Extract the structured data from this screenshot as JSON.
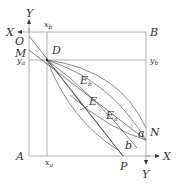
{
  "diagram": {
    "type": "geometric construction",
    "points": {
      "O": "O",
      "M": "M",
      "D": "D",
      "B": "B",
      "A": "A",
      "N": "N",
      "P": "P",
      "E": "E",
      "Eb_main": "E",
      "Eb_sub": "b",
      "Ea_main": "E",
      "Ea_sub": "a",
      "a": "a",
      "b": "b"
    },
    "axes": {
      "top_left_x": "X",
      "top_left_y": "Y",
      "bottom_right_x": "X",
      "bottom_right_y": "Y"
    },
    "guides": {
      "xb_main": "x",
      "xb_sub": "b",
      "xa_main": "x",
      "xa_sub": "a",
      "ya_main": "y",
      "ya_sub": "a",
      "yb_main": "y",
      "yb_sub": "b"
    }
  }
}
